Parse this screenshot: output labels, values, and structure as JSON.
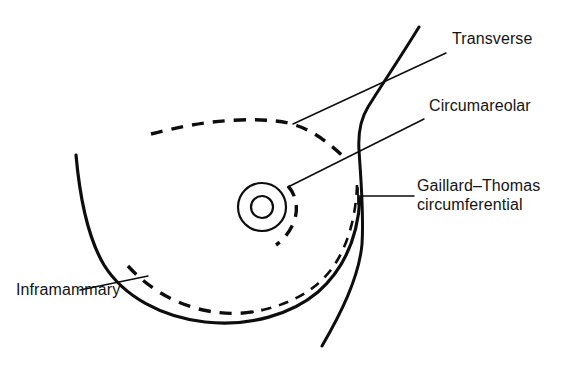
{
  "figure": {
    "background_color": "#ffffff",
    "ink_color": "#0d0d0d",
    "width": 566,
    "height": 367
  },
  "labels": {
    "transverse": "Transverse",
    "circumareolar": "Circumareolar",
    "gaillard_thomas_line1": "Gaillard–Thomas",
    "gaillard_thomas_line2": "circumferential",
    "inframammary": "Inframammary"
  },
  "anatomy": {
    "breast_contour_name": "breast-contour",
    "torso_contour_name": "chest-wall-contour",
    "areola_name": "areola",
    "nipple_name": "nipple"
  },
  "incisions": [
    {
      "id": "transverse",
      "label": "Transverse",
      "style": "dashed",
      "description": "Upper transverse dashed incision line arcing across the superior breast"
    },
    {
      "id": "circumareolar",
      "label": "Circumareolar",
      "style": "dashed",
      "description": "Short dashed arc following the lateral margin of the areola"
    },
    {
      "id": "gaillard-thomas-circumferential",
      "label": "Gaillard–Thomas circumferential",
      "style": "dashed",
      "description": "Dashed arc running just inside the lateral and inferior breast contour"
    },
    {
      "id": "inframammary",
      "label": "Inframammary",
      "style": "dashed",
      "description": "Dashed line along the inferior mammary fold"
    }
  ]
}
